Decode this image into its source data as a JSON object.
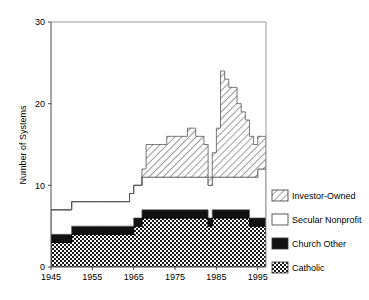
{
  "chart_data": {
    "type": "area",
    "stacked": true,
    "title": "",
    "subtitle": "",
    "xlabel": "",
    "ylabel": "Number of Systems",
    "xlim": [
      1945,
      1997
    ],
    "ylim": [
      0,
      30
    ],
    "yticks": [
      0,
      10,
      20,
      30
    ],
    "xticks": [
      1945,
      1955,
      1965,
      1975,
      1985,
      1995
    ],
    "ytick_labels": [
      "0",
      "10",
      "20",
      "30"
    ],
    "xtick_labels": [
      "1945",
      "1955",
      "1965",
      "1975",
      "1985",
      "1995"
    ],
    "grid": false,
    "legend_position": "right",
    "x": [
      1945,
      1946,
      1947,
      1948,
      1949,
      1950,
      1951,
      1952,
      1953,
      1954,
      1955,
      1956,
      1957,
      1958,
      1959,
      1960,
      1961,
      1962,
      1963,
      1964,
      1965,
      1966,
      1967,
      1968,
      1969,
      1970,
      1971,
      1972,
      1973,
      1974,
      1975,
      1976,
      1977,
      1978,
      1979,
      1980,
      1981,
      1982,
      1983,
      1984,
      1985,
      1986,
      1987,
      1988,
      1989,
      1990,
      1991,
      1992,
      1993,
      1994,
      1995,
      1996,
      1997
    ],
    "series": [
      {
        "name": "Catholic",
        "fill": "checker",
        "color": "#000000",
        "values": [
          3,
          3,
          3,
          3,
          3,
          4,
          4,
          4,
          4,
          4,
          4,
          4,
          4,
          4,
          4,
          4,
          4,
          4,
          4,
          4,
          5,
          5,
          6,
          6,
          6,
          6,
          6,
          6,
          6,
          6,
          6,
          6,
          6,
          6,
          6,
          6,
          6,
          6,
          5,
          6,
          6,
          6,
          6,
          6,
          6,
          6,
          6,
          6,
          5,
          5,
          5,
          5,
          4
        ]
      },
      {
        "name": "Church Other",
        "fill": "solid-black",
        "color": "#000000",
        "values": [
          1,
          1,
          1,
          1,
          1,
          1,
          1,
          1,
          1,
          1,
          1,
          1,
          1,
          1,
          1,
          1,
          1,
          1,
          1,
          1,
          1,
          1,
          1,
          1,
          1,
          1,
          1,
          1,
          1,
          1,
          1,
          1,
          1,
          1,
          1,
          1,
          1,
          1,
          1,
          1,
          1,
          1,
          1,
          1,
          1,
          1,
          1,
          1,
          1,
          1,
          1,
          1,
          1
        ]
      },
      {
        "name": "Secular Nonprofit",
        "fill": "white",
        "color": "#ffffff",
        "values": [
          3,
          3,
          3,
          3,
          3,
          3,
          3,
          3,
          3,
          3,
          3,
          3,
          3,
          3,
          3,
          3,
          3,
          3,
          3,
          4,
          4,
          4,
          4,
          4,
          4,
          4,
          4,
          4,
          4,
          4,
          4,
          4,
          4,
          4,
          4,
          4,
          4,
          4,
          4,
          4,
          4,
          4,
          4,
          4,
          4,
          4,
          4,
          4,
          5,
          5,
          6,
          6,
          7
        ]
      },
      {
        "name": "Investor-Owned",
        "fill": "diagonal-hatch",
        "color": "#000000",
        "values": [
          0,
          0,
          0,
          0,
          0,
          0,
          0,
          0,
          0,
          0,
          0,
          0,
          0,
          0,
          0,
          0,
          0,
          0,
          0,
          0,
          0,
          0,
          1,
          4,
          4,
          4,
          4,
          4,
          5,
          5,
          5,
          5,
          5,
          6,
          6,
          5,
          5,
          4,
          1,
          3,
          6,
          13,
          12,
          11,
          11,
          9,
          8,
          7,
          5,
          4,
          4,
          4,
          3
        ]
      }
    ],
    "totals": [
      7,
      7,
      7,
      7,
      7,
      8,
      8,
      8,
      8,
      8,
      8,
      8,
      8,
      8,
      8,
      8,
      8,
      8,
      8,
      9,
      10,
      10,
      12,
      15,
      15,
      15,
      15,
      15,
      16,
      16,
      16,
      16,
      16,
      17,
      17,
      16,
      16,
      15,
      11,
      14,
      17,
      24,
      23,
      22,
      22,
      20,
      19,
      18,
      16,
      15,
      16,
      16,
      15
    ],
    "notes": {
      "peak_year": 1986,
      "peak_total": 24
    }
  },
  "legend": {
    "items": [
      {
        "label": "Investor-Owned",
        "swatch": "diagonal-hatch"
      },
      {
        "label": "Secular Nonprofit",
        "swatch": "white"
      },
      {
        "label": "Church Other",
        "swatch": "solid-black"
      },
      {
        "label": "Catholic",
        "swatch": "checker"
      }
    ]
  },
  "axes": {
    "y_title": "Number of Systems"
  }
}
